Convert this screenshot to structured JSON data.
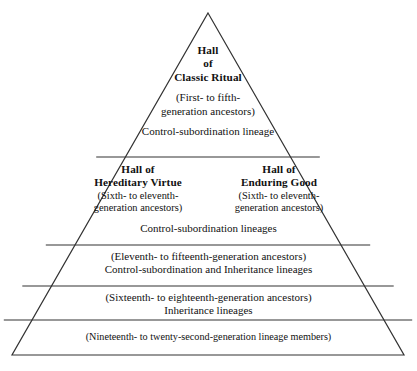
{
  "diagram": {
    "type": "pyramid",
    "background_color": "#ffffff",
    "line_color": "#333333",
    "text_color": "#111111",
    "geometry": {
      "apex": [
        208,
        13
      ],
      "base_left": [
        12,
        355
      ],
      "base_right": [
        404,
        355
      ],
      "divider_y": [
        157,
        245,
        286,
        320
      ]
    },
    "tiers": [
      {
        "id": "tier-1",
        "name": "hall-of-classic-ritual",
        "heading_lines": [
          "Hall",
          "of",
          "Classic Ritual"
        ],
        "detail_lines": [
          "(First- to fifth-",
          "generation ancestors)"
        ],
        "footer_lines": [
          "Control-subordination lineage"
        ]
      },
      {
        "id": "tier-2",
        "name": "hereditary-virtue-and-enduring-good",
        "halls": [
          {
            "name": "hall-of-hereditary-virtue",
            "heading_lines": [
              "Hall of",
              "Hereditary Virtue"
            ],
            "detail_lines": [
              "(Sixth- to eleventh-",
              "generation ancestors)"
            ]
          },
          {
            "name": "hall-of-enduring-good",
            "heading_lines": [
              "Hall of",
              "Enduring Good"
            ],
            "detail_lines": [
              "(Sixth- to eleventh-",
              "generation ancestors)"
            ]
          }
        ],
        "footer_lines": [
          "Control-subordination lineages"
        ]
      },
      {
        "id": "tier-3",
        "name": "eleventh-to-fifteenth-generation",
        "detail_lines": [
          "(Eleventh- to fifteenth-generation ancestors)",
          "Control-subordination and Inheritance lineages"
        ]
      },
      {
        "id": "tier-4",
        "name": "sixteenth-to-eighteenth-generation",
        "detail_lines": [
          "(Sixteenth- to eighteenth-generation ancestors)",
          "Inheritance lineages"
        ]
      },
      {
        "id": "tier-5",
        "name": "nineteenth-to-twenty-second-generation",
        "detail_lines": [
          "(Nineteenth- to twenty-second-generation lineage members)"
        ]
      }
    ]
  }
}
